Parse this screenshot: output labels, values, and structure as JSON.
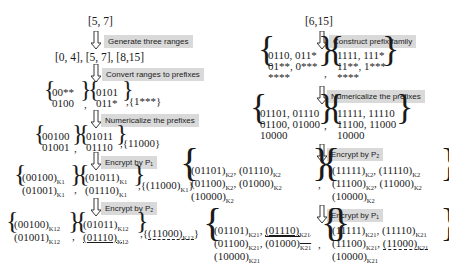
{
  "left": {
    "input": "[5, 7]",
    "steps": [
      {
        "label": "Generate three ranges"
      },
      {
        "label": "Convert ranges to prefixes"
      },
      {
        "label": "Numericalize the prefixes"
      },
      {
        "label": "Encrypt by P₁"
      },
      {
        "label": "Encrypt by P₂"
      }
    ],
    "ranges": "[0, 4], [5, 7], [8,15]",
    "prefixes": {
      "set1": [
        "00**",
        "0100"
      ],
      "set2": [
        "0101",
        "011*"
      ],
      "set3": "{1***}"
    },
    "numeric": {
      "set1": [
        "00100",
        "01001"
      ],
      "set2": [
        "01011",
        "01110"
      ],
      "set3": "{11000}"
    },
    "enc1": {
      "set1": [
        "(00100)",
        "(01001)"
      ],
      "set2": [
        "(01011)",
        "(01110)"
      ],
      "set3": "(11000)",
      "key": "K1"
    },
    "enc2": {
      "set1": [
        "(00100)",
        "(01001)"
      ],
      "set2": [
        "(01011)",
        "(01110)"
      ],
      "set3": "(11000)",
      "key": "K12"
    }
  },
  "right": {
    "input": "[6,15]",
    "steps": [
      {
        "label": "Construct prefix family"
      },
      {
        "label": "Numericalize the prefixes"
      },
      {
        "label": "Encrypt by P₂"
      },
      {
        "label": "Encrypt by P₁"
      }
    ],
    "family": {
      "set1": [
        "0110, 011*",
        "01**, 0***",
        "****"
      ],
      "set2": [
        "1111, 111*",
        "11**, 1***",
        "****"
      ]
    },
    "numeric": {
      "set1": [
        "01101, 01110",
        "01100, 01000",
        "10000"
      ],
      "set2": [
        "11111, 11110",
        "11100, 11000",
        "10000"
      ]
    },
    "enc2": {
      "set1": [
        [
          "(01101)",
          "(01110)"
        ],
        [
          "(01100)",
          "(01000)"
        ],
        [
          "(10000)"
        ]
      ],
      "set2": [
        [
          "(11111)",
          "(11110)"
        ],
        [
          "(11100)",
          "(11000)"
        ],
        [
          "(10000)"
        ]
      ],
      "key": "K2"
    },
    "enc21": {
      "set1": [
        [
          "(01101)",
          "(01110)"
        ],
        [
          "(01100)",
          "(01000)"
        ],
        [
          "(10000)"
        ]
      ],
      "set2": [
        [
          "(11111)",
          "(11110)"
        ],
        [
          "(11100)",
          "(11000)"
        ],
        [
          "(10000)"
        ]
      ],
      "key": "K21"
    }
  }
}
